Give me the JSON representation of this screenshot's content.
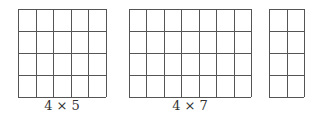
{
  "grids": [
    {
      "rows": 4,
      "cols": 5,
      "x": 18,
      "y": 9,
      "w": 88,
      "h": 88,
      "label": "4 × 5"
    },
    {
      "rows": 4,
      "cols": 7,
      "x": 129,
      "y": 9,
      "w": 122,
      "h": 88,
      "label": "4 × 7"
    },
    {
      "rows": 4,
      "cols": 2,
      "x": 269,
      "y": 9,
      "w": 35,
      "h": 88,
      "label": ""
    }
  ],
  "style": {
    "line_color": "#555555"
  }
}
